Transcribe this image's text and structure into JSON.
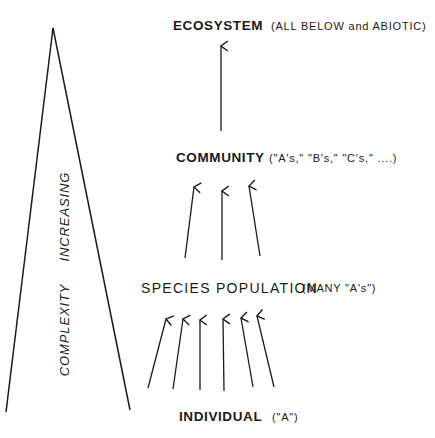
{
  "diagram": {
    "type": "hierarchy",
    "side_label": {
      "words": [
        "COMPLEXITY",
        "INCREASING"
      ],
      "orientation": "vertical-bottom-to-top"
    },
    "levels": [
      {
        "name": "ECOSYSTEM",
        "note": "(ALL BELOW and ABIOTIC)"
      },
      {
        "name": "COMMUNITY",
        "note": "(\"A's,\"  \"B's,\"  \"C's,\" ....)"
      },
      {
        "name": "SPECIES POPULATION",
        "note": "(MANY \"A's\")"
      },
      {
        "name": "INDIVIDUAL",
        "note": "(\"A\")"
      }
    ],
    "arrows": {
      "individual_to_population": 6,
      "population_to_community": 3,
      "community_to_ecosystem": 1
    },
    "colors": {
      "ink": "#1a1a1a",
      "background": "#ffffff"
    }
  }
}
